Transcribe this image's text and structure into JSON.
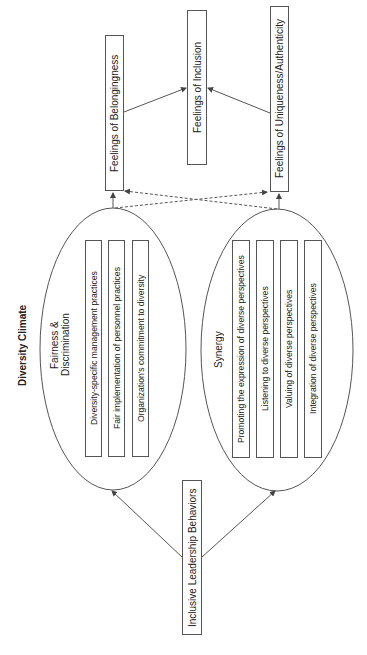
{
  "title": "Diversity Climate",
  "outcomes": {
    "belongingness": "Feelings of Belongingness",
    "inclusion": "Feelings of Inclusion",
    "uniqueness": "Feelings of Uniqueness/Authenticity"
  },
  "antecedent": "Inclusive Leadership Behaviors",
  "clusters": [
    {
      "label_line1": "Fairness &",
      "label_line2": "Discrimination",
      "items": [
        "Diversity-specific management practices",
        "Fair implementation of personnel practices",
        "Organization's commitment to diversity"
      ]
    },
    {
      "label": "Synergy",
      "items": [
        "Promoting the expression of diverse perspectives",
        "Listening to diverse perspectives",
        "Valuing of diverse perspectives",
        "Integration of diverse perspectives"
      ]
    }
  ],
  "colors": {
    "line": "#555555",
    "text": "#222222"
  }
}
